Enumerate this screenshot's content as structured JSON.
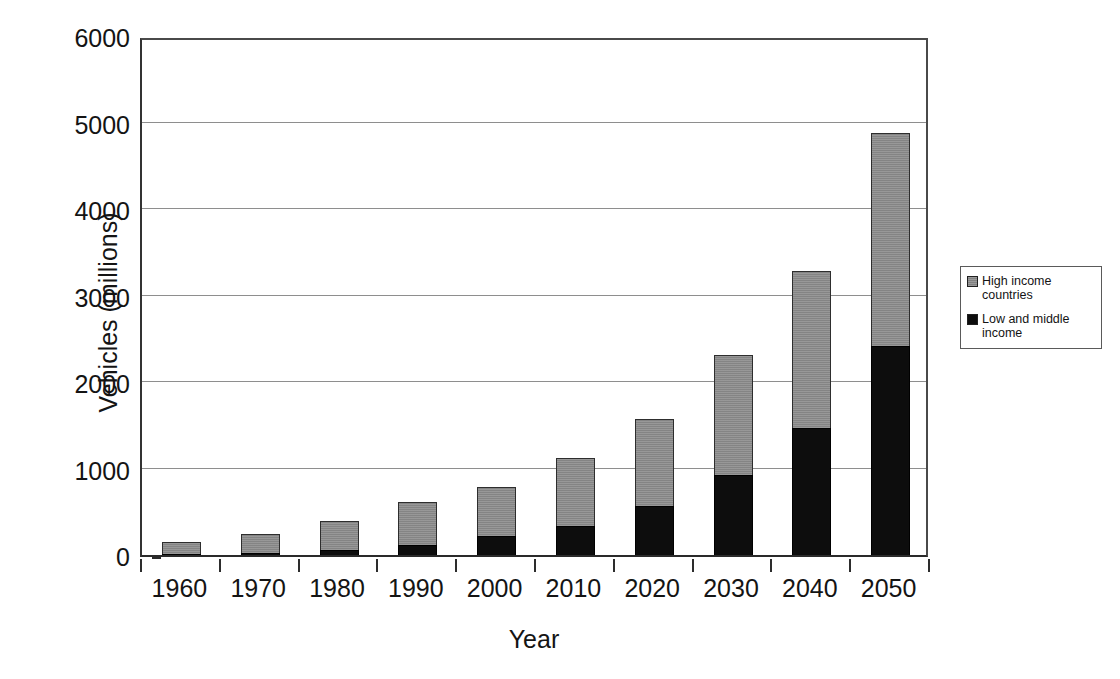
{
  "chart_data": {
    "type": "bar",
    "subtype": "stacked-vertical-bar",
    "title": "",
    "xlabel": "Year",
    "ylabel": "Vehicles (millions)",
    "categories": [
      "1960",
      "1970",
      "1980",
      "1990",
      "2000",
      "2010",
      "2020",
      "2030",
      "2040",
      "2050"
    ],
    "series": [
      {
        "name": "Low and middle income",
        "color": "#0d0d0d",
        "values": [
          15,
          25,
          58,
          116,
          220,
          335,
          566,
          925,
          1468,
          2416
        ]
      },
      {
        "name": "High income countries",
        "color": "#8c8c8c",
        "values": [
          135,
          218,
          335,
          497,
          566,
          786,
          1006,
          1387,
          1815,
          2462
        ]
      }
    ],
    "totals": [
      150,
      243,
      393,
      613,
      786,
      1121,
      1572,
      2312,
      3283,
      4878
    ],
    "ylim": [
      0,
      6000
    ],
    "yticks": [
      0,
      1000,
      2000,
      3000,
      4000,
      5000,
      6000
    ],
    "ytick_labels": [
      "0",
      "1000",
      "2000",
      "3000",
      "4000",
      "5000",
      "6000"
    ],
    "grid": true,
    "grid_axis": "y",
    "legend_position": "right",
    "legend_entries": [
      {
        "label": "High income countries",
        "swatch": "gray"
      },
      {
        "label": "Low and middle income",
        "swatch": "black"
      }
    ]
  },
  "axes": {
    "y_title": "Vehicles (millions)",
    "x_title": "Year"
  },
  "legend": {
    "entries": [
      {
        "label": "High income countries"
      },
      {
        "label": "Low and middle income"
      }
    ]
  },
  "colors": {
    "low_income": "#0d0d0d",
    "high_income": "#8c8c8c",
    "axis": "#2a2a2a",
    "grid": "#8e8e8e",
    "background": "#ffffff"
  }
}
